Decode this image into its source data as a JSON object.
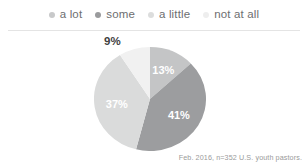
{
  "legend": {
    "items": [
      {
        "label": "a lot",
        "color": "#c8c9ca",
        "dot_name": "legend-dot-a-lot"
      },
      {
        "label": "some",
        "color": "#9a9b9d",
        "dot_name": "legend-dot-some"
      },
      {
        "label": "a little",
        "color": "#dcdddd",
        "dot_name": "legend-dot-a-little"
      },
      {
        "label": "not at all",
        "color": "#eeeeee",
        "dot_name": "legend-dot-not-at-all"
      }
    ]
  },
  "outside_label": "9%",
  "footnote": "Feb. 2016, n=352 U.S. youth pastors.",
  "chart_data": {
    "type": "pie",
    "title": "",
    "subtitle": "",
    "xlabel": "",
    "ylabel": "",
    "legend_position": "top",
    "grid": false,
    "start_angle_deg": 0,
    "direction": "clockwise",
    "categories": [
      "a lot",
      "some",
      "a little",
      "not at all"
    ],
    "values": [
      13,
      41,
      37,
      9
    ],
    "value_labels": [
      "13%",
      "41%",
      "37%",
      "9%"
    ],
    "colors": [
      "#c4c5c6",
      "#9c9d9f",
      "#dadbdb",
      "#f1f1f1"
    ],
    "label_placement": [
      "inside",
      "inside",
      "inside",
      "outside"
    ],
    "label_colors": [
      "#ffffff",
      "#ffffff",
      "#ffffff",
      "#3f3f3f"
    ],
    "annotations": [
      "Feb. 2016, n=352 U.S. youth pastors."
    ]
  }
}
